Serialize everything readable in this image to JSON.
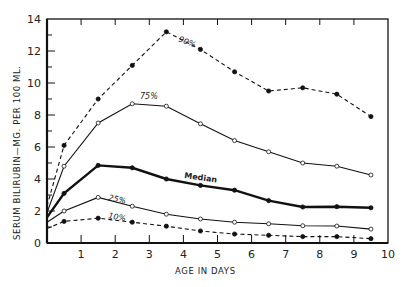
{
  "chart_data": {
    "type": "line",
    "title": "",
    "xlabel": "AGE IN DAYS",
    "ylabel": "SERUM BILIRUBIN—MG. PER 100 ML.",
    "xlim": [
      0,
      10
    ],
    "ylim": [
      0,
      14
    ],
    "x_ticks": [
      1,
      2,
      3,
      4,
      5,
      6,
      7,
      8,
      9,
      10
    ],
    "y_ticks": [
      0,
      2,
      4,
      6,
      8,
      10,
      12,
      14
    ],
    "grid": false,
    "legend": "inline labels on lines",
    "x": [
      0,
      0.5,
      1.5,
      2.5,
      3.5,
      4.5,
      5.5,
      6.5,
      7.5,
      8.5,
      9.5
    ],
    "series": [
      {
        "name": "90%",
        "style": "dashed",
        "marker": "filled",
        "values": [
          2.3,
          6.1,
          9.0,
          11.1,
          13.2,
          12.1,
          10.7,
          9.5,
          9.7,
          9.3,
          7.9
        ]
      },
      {
        "name": "75%",
        "style": "solid",
        "marker": "open",
        "values": [
          1.9,
          4.8,
          7.5,
          8.7,
          8.55,
          7.45,
          6.4,
          5.7,
          5.0,
          4.8,
          4.25
        ]
      },
      {
        "name": "Median",
        "style": "solid-bold",
        "marker": "filled",
        "values": [
          1.6,
          3.1,
          4.85,
          4.7,
          4.0,
          3.6,
          3.3,
          2.65,
          2.25,
          2.27,
          2.2
        ]
      },
      {
        "name": "25%",
        "style": "solid",
        "marker": "open",
        "values": [
          1.3,
          2.0,
          2.85,
          2.3,
          1.8,
          1.5,
          1.3,
          1.2,
          1.08,
          1.06,
          0.87
        ]
      },
      {
        "name": "10%",
        "style": "dashed",
        "marker": "filled",
        "values": [
          0.9,
          1.35,
          1.55,
          1.3,
          1.05,
          0.75,
          0.56,
          0.48,
          0.4,
          0.4,
          0.27
        ]
      }
    ]
  },
  "labels": {
    "p90": "90%",
    "p75": "75%",
    "median": "Median",
    "p25": "25%",
    "p10": "10%"
  }
}
